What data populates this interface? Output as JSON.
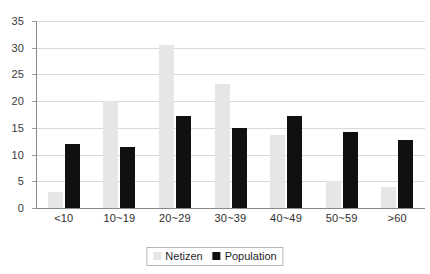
{
  "chart_data": {
    "type": "bar",
    "title": "",
    "subtitle": "",
    "xlabel": "",
    "ylabel": "",
    "categories": [
      "<10",
      "10~19",
      "20~29",
      "30~39",
      "40~49",
      "50~59",
      ">60"
    ],
    "series": [
      {
        "name": "Netizen",
        "color": "#e6e6e6",
        "values": [
          3.0,
          20.0,
          30.5,
          23.3,
          13.6,
          5.0,
          4.0
        ]
      },
      {
        "name": "Population",
        "color": "#101010",
        "values": [
          12.0,
          11.5,
          17.2,
          15.0,
          17.2,
          14.3,
          12.8
        ]
      }
    ],
    "ylim": [
      0,
      35
    ],
    "y_ticks": [
      0,
      5,
      10,
      15,
      20,
      25,
      30,
      35
    ],
    "grid": true,
    "legend_position": "bottom-center"
  },
  "legend": {
    "items": [
      {
        "label": "Netizen"
      },
      {
        "label": "Population"
      }
    ]
  }
}
